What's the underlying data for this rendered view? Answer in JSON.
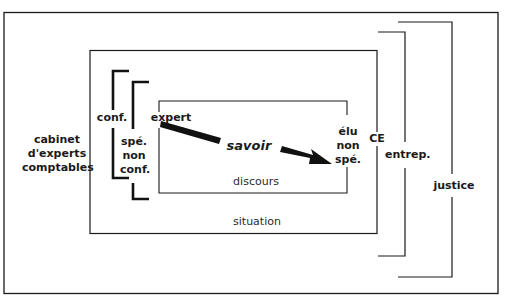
{
  "diagram": {
    "type": "nested-boxes-with-brackets",
    "colors": {
      "line": "#1a1a1a",
      "background": "#ffffff"
    },
    "boxes": {
      "outer": {
        "label": ""
      },
      "situation": {
        "label": "situation"
      },
      "discours": {
        "label": "discours"
      }
    },
    "brackets_left": {
      "conf": {
        "label": "conf."
      },
      "spe_non_conf": {
        "lines": [
          "spé.",
          "non",
          "conf."
        ]
      }
    },
    "brackets_right": {
      "entrep": {
        "label": "entrep."
      },
      "justice": {
        "label": "justice"
      }
    },
    "nodes": {
      "cabinet": {
        "lines": [
          "cabinet",
          "d'experts",
          "comptables"
        ]
      },
      "expert": {
        "label": "expert"
      },
      "elu": {
        "lines": [
          "élu",
          "non",
          "spé."
        ]
      },
      "ce": {
        "label": "CE"
      }
    },
    "arrow": {
      "label": "savoir",
      "from": "expert",
      "to": "élu non spé."
    }
  }
}
